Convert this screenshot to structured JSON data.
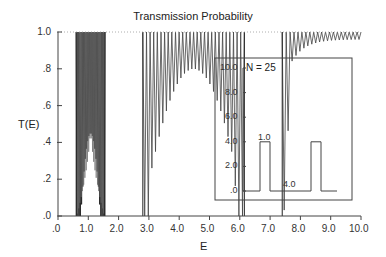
{
  "chart_data": {
    "type": "line",
    "title": "Transmission Probability",
    "xlabel": "E",
    "ylabel": "T(E)",
    "xlim": [
      0.0,
      10.0
    ],
    "ylim": [
      0.0,
      1.0
    ],
    "x_ticks": [
      ".0",
      "1.0",
      "2.0",
      "3.0",
      "4.0",
      "5.0",
      "6.0",
      "7.0",
      "8.0",
      "9.0",
      "10.0"
    ],
    "y_ticks": [
      ".0",
      ".2",
      ".4",
      ".6",
      ".8",
      "1.0"
    ],
    "grid": false,
    "reference_line": {
      "y": 1.0,
      "style": "dotted"
    },
    "series": [
      {
        "name": "T(E), N = 25",
        "description": "Rapidly oscillating transmission with allowed bands and gaps",
        "bands": [
          {
            "E_start": 0.6,
            "E_end": 1.55,
            "min_envelope_center": 0.45
          },
          {
            "E_start": 2.8,
            "E_end": 6.15,
            "min_envelope_center": 0.8
          },
          {
            "E_start": 7.4,
            "E_end": 10.0,
            "min_envelope_end": 0.95
          }
        ],
        "gaps": [
          {
            "E_start": 0.0,
            "E_end": 0.6
          },
          {
            "E_start": 1.55,
            "E_end": 2.8
          },
          {
            "E_start": 6.15,
            "E_end": 7.4
          }
        ]
      }
    ],
    "inset": {
      "label": "N = 25",
      "description": "Periodic square potential barriers",
      "y_ticks": [
        ".0",
        "2.0",
        "4.0",
        "6.0",
        "8.0",
        "10.0"
      ],
      "barrier_height": 4.0,
      "barrier_width": 1.0,
      "barrier_spacing": 4.0,
      "annotations": [
        "1.0",
        "4.0"
      ]
    }
  },
  "labels": {
    "title": "Transmission Probability",
    "xlabel": "E",
    "ylabel": "T(E)",
    "inset_n": "N = 25",
    "inset_width": "1.0",
    "inset_spacing": "4.0"
  },
  "x_tick_labels": [
    ".0",
    "1.0",
    "2.0",
    "3.0",
    "4.0",
    "5.0",
    "6.0",
    "7.0",
    "8.0",
    "9.0",
    "10.0"
  ],
  "y_tick_labels": [
    ".0",
    ".2",
    ".4",
    ".6",
    ".8",
    "1.0"
  ],
  "inset_y_tick_labels": [
    ".0",
    "2.0",
    "4.0",
    "6.0",
    "8.0",
    "10.0"
  ],
  "colors": {
    "axis": "#444444",
    "curve": "#333333",
    "curve_light": "#777777"
  }
}
